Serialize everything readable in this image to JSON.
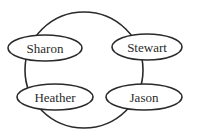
{
  "diagram": {
    "type": "graph",
    "nodes": [
      {
        "id": "sharon",
        "label": "Sharon",
        "cx": 45,
        "cy": 48,
        "rx": 37,
        "ry": 13
      },
      {
        "id": "stewart",
        "label": "Stewart",
        "cx": 147,
        "cy": 47,
        "rx": 35,
        "ry": 13
      },
      {
        "id": "heather",
        "label": "Heather",
        "cx": 55,
        "cy": 97,
        "rx": 38,
        "ry": 13
      },
      {
        "id": "jason",
        "label": "Jason",
        "cx": 144,
        "cy": 97,
        "rx": 38,
        "ry": 13
      }
    ],
    "edges": [
      {
        "from": "sharon",
        "to": "stewart"
      },
      {
        "from": "stewart",
        "to": "jason"
      },
      {
        "from": "jason",
        "to": "heather"
      },
      {
        "from": "heather",
        "to": "sharon"
      }
    ]
  }
}
